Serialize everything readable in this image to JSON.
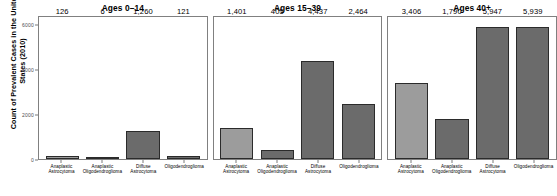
{
  "chart_data": {
    "type": "bar",
    "title": "",
    "xlabel": "",
    "ylabel": "Count of Prevalent Cases in the United States (2010)",
    "ylim": [
      0,
      6400
    ],
    "grid": false,
    "legend": "none",
    "facet_by": "age group",
    "categories": [
      "Anaplastic Astrocytoma",
      "Anaplastic Oligodendroglioma",
      "Diffuse Astrocytoma",
      "Oligodendroglioma"
    ],
    "category_lines": [
      [
        "Anaplastic",
        "Astrocytoma"
      ],
      [
        "Anaplastic",
        "Oligodendroglioma"
      ],
      [
        "Diffuse",
        "Astrocytoma"
      ],
      [
        "Oligodendroglioma",
        ""
      ]
    ],
    "y_ticks": [
      0,
      2000,
      4000,
      6000
    ],
    "y_tick_labels": [
      "0",
      "2000",
      "4000",
      "6000"
    ],
    "panels": [
      {
        "title": "Ages 0–14",
        "values": [
          126,
          6,
          1260,
          121
        ],
        "labels": [
          "126",
          "6",
          "1,260",
          "121"
        ]
      },
      {
        "title": "Ages 15–39",
        "values": [
          1401,
          405,
          4437,
          2464
        ],
        "labels": [
          "1,401",
          "405",
          "4,437",
          "2,464"
        ]
      },
      {
        "title": "Ages 40+",
        "values": [
          3406,
          1790,
          5947,
          5939
        ],
        "labels": [
          "3,406",
          "1,790",
          "5,947",
          "5,939"
        ]
      }
    ],
    "series": [
      {
        "name": "Ages 0–14",
        "values": [
          126,
          6,
          1260,
          121
        ]
      },
      {
        "name": "Ages 15–39",
        "values": [
          1401,
          405,
          4437,
          2464
        ]
      },
      {
        "name": "Ages 40+",
        "values": [
          3406,
          1790,
          5947,
          5939
        ]
      }
    ],
    "colors": {
      "bar_light": "#9c9c9c",
      "bar_dark": "#6b6b6b",
      "bar_border": "#2b2b2b",
      "panel_border": "#808080",
      "axis_text": "#4d4d4d",
      "background": "#ffffff"
    },
    "bar_colors": [
      "#9c9c9c",
      "#6b6b6b",
      "#6b6b6b",
      "#6b6b6b"
    ]
  }
}
